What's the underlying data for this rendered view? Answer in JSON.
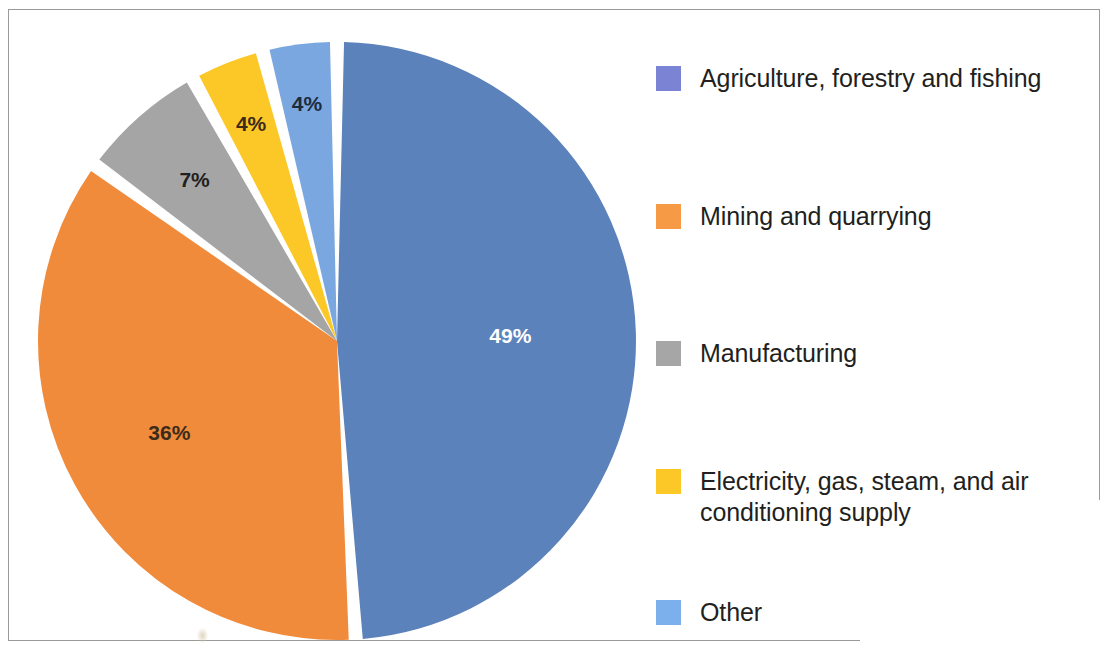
{
  "chart_data": {
    "type": "pie",
    "title": "",
    "subtitle": "",
    "xlabel": "",
    "ylabel": "",
    "legend_position": "right",
    "grid": false,
    "start_angle_deg": 0,
    "direction": "clockwise",
    "categories": [
      "Agriculture, forestry and fishing",
      "Mining and quarrying",
      "Manufacturing",
      "Electricity, gas, steam, and air conditioning supply",
      "Other"
    ],
    "values": [
      49,
      36,
      7,
      4,
      4
    ],
    "value_labels": [
      "49%",
      "36%",
      "7%",
      "4%",
      "4%"
    ],
    "slice_colors": [
      "#5b82bb",
      "#f08b3c",
      "#a5a5a5",
      "#fcc828",
      "#7ba7e0"
    ],
    "slice_label_colors": [
      "#ffffff",
      "#3d2b1a",
      "#231f20",
      "#3d2b1a",
      "#1c2b3f"
    ],
    "legend_swatch_colors": [
      "#7b84d4",
      "#f79a45",
      "#a6a6a6",
      "#fcc828",
      "#7cb0ec"
    ],
    "separator_color": "#ffffff"
  },
  "chart": {
    "slices": [
      {
        "label": "Agriculture, forestry and fishing",
        "value": 49,
        "value_label": "49%",
        "color": "#5b82bb",
        "label_color": "#ffffff"
      },
      {
        "label": "Mining and quarrying",
        "value": 36,
        "value_label": "36%",
        "color": "#f08b3c",
        "label_color": "#3d2b1a"
      },
      {
        "label": "Manufacturing",
        "value": 7,
        "value_label": "7%",
        "color": "#a5a5a5",
        "label_color": "#231f20"
      },
      {
        "label": "Electricity, gas, steam, and air conditioning supply",
        "value": 4,
        "value_label": "4%",
        "color": "#fcc828",
        "label_color": "#3d2b1a"
      },
      {
        "label": "Other",
        "value": 4,
        "value_label": "4%",
        "color": "#7ba7e0",
        "label_color": "#1c2b3f"
      }
    ]
  },
  "legend": {
    "items": [
      {
        "label": "Agriculture, forestry and fishing",
        "color": "#7b84d4"
      },
      {
        "label": "Mining and quarrying",
        "color": "#f79a45"
      },
      {
        "label": "Manufacturing",
        "color": "#a6a6a6"
      },
      {
        "label": "Electricity, gas, steam, and air conditioning supply",
        "color": "#fcc828"
      },
      {
        "label": "Other",
        "color": "#7cb0ec"
      }
    ]
  }
}
